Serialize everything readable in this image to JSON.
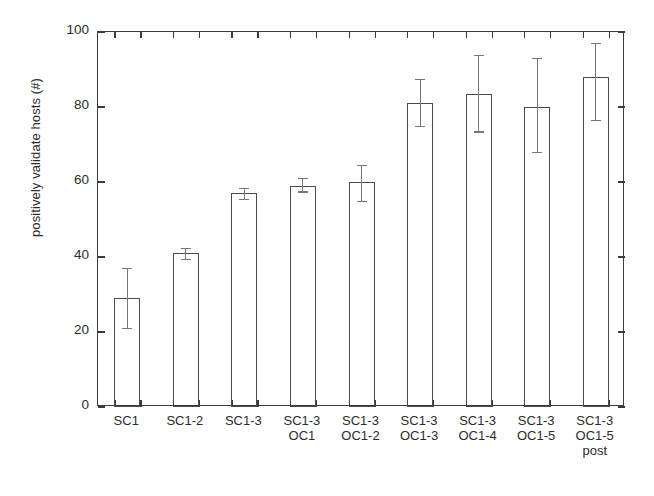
{
  "chart_data": {
    "type": "bar",
    "title": "",
    "xlabel": "",
    "ylabel": "positively validate hosts (#)",
    "ylim": [
      0,
      100
    ],
    "yticks": [
      0,
      20,
      40,
      60,
      80,
      100
    ],
    "ytick_labels": [
      "0",
      "20",
      "40",
      "60",
      "80",
      "100"
    ],
    "grid": false,
    "legend": "none",
    "error_bars": "yes",
    "categories": [
      "SC1",
      "SC1-2",
      "SC1-3",
      "SC1-3\nOC1",
      "SC1-3\nOC1-2",
      "SC1-3\nOC1-3",
      "SC1-3\nOC1-4",
      "SC1-3\nOC1-5",
      "SC1-3\nOC1-5\npost"
    ],
    "values": [
      29,
      41,
      57,
      59,
      60,
      81,
      83.5,
      80,
      88
    ],
    "err_upper": [
      37,
      42.5,
      58.5,
      61,
      64.5,
      87.5,
      94,
      93,
      97
    ],
    "err_lower": [
      21,
      39.5,
      55.5,
      57.5,
      55,
      75,
      73.5,
      68,
      76.5
    ]
  },
  "axis": {
    "y_label_text": "positively validate hosts (#)"
  }
}
